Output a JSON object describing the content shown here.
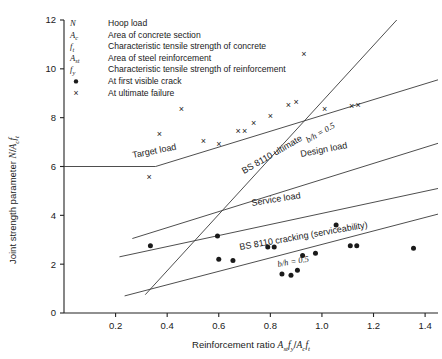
{
  "chart_data": {
    "type": "scatter",
    "title": "",
    "xlabel": "Reinforcement ratio Ast fy / Ac ft",
    "ylabel": "Joint strength parameter N / Ac ft",
    "xlim": [
      0.0,
      1.45
    ],
    "ylim": [
      0,
      12
    ],
    "xticks": [
      "0.2",
      "0.4",
      "0.6",
      "0.8",
      "1.0",
      "1.2",
      "1.4"
    ],
    "xtick_values": [
      0.2,
      0.4,
      0.6,
      0.8,
      1.0,
      1.2,
      1.4
    ],
    "yticks": [
      "0",
      "2",
      "4",
      "6",
      "8",
      "10",
      "12"
    ],
    "ytick_values": [
      0,
      2,
      4,
      6,
      8,
      10,
      12
    ],
    "grid": false,
    "legend_position": "top-left",
    "series": [
      {
        "name": "At first visible crack",
        "marker": "dot",
        "points": [
          [
            0.335,
            2.75
          ],
          [
            0.595,
            3.15
          ],
          [
            0.6,
            2.2
          ],
          [
            0.655,
            2.15
          ],
          [
            0.79,
            2.7
          ],
          [
            0.815,
            2.7
          ],
          [
            0.845,
            1.6
          ],
          [
            0.88,
            1.55
          ],
          [
            0.905,
            1.75
          ],
          [
            0.925,
            2.35
          ],
          [
            0.975,
            2.45
          ],
          [
            1.055,
            3.6
          ],
          [
            1.11,
            2.75
          ],
          [
            1.135,
            2.75
          ],
          [
            1.355,
            2.65
          ]
        ]
      },
      {
        "name": "At ultimate failure",
        "marker": "cross",
        "points": [
          [
            0.33,
            5.6
          ],
          [
            0.37,
            7.35
          ],
          [
            0.455,
            8.35
          ],
          [
            0.54,
            7.05
          ],
          [
            0.6,
            6.95
          ],
          [
            0.675,
            7.45
          ],
          [
            0.7,
            7.45
          ],
          [
            0.735,
            7.8
          ],
          [
            0.8,
            8.1
          ],
          [
            0.87,
            8.55
          ],
          [
            0.9,
            8.65
          ],
          [
            0.93,
            10.6
          ],
          [
            1.01,
            8.35
          ],
          [
            1.115,
            8.5
          ],
          [
            1.14,
            8.55
          ]
        ]
      }
    ],
    "lines": [
      {
        "name": "Target load",
        "label": "Target load",
        "points": [
          [
            0.0,
            6.0
          ],
          [
            0.355,
            6.0
          ],
          [
            1.45,
            9.55
          ]
        ]
      },
      {
        "name": "BS 8110 ultimate",
        "label": "BS 8110 ultimate",
        "sublabel": "b/h = 0.5",
        "points": [
          [
            0.315,
            0.75
          ],
          [
            1.29,
            12.0
          ]
        ]
      },
      {
        "name": "Design load",
        "label": "Design load",
        "points": [
          [
            0.265,
            3.05
          ],
          [
            1.45,
            6.95
          ]
        ]
      },
      {
        "name": "Service load",
        "label": "Service load",
        "points": [
          [
            0.215,
            2.3
          ],
          [
            1.45,
            5.1
          ]
        ]
      },
      {
        "name": "BS 8110 cracking (serviceability)",
        "label": "BS 8110 cracking (serviceability)",
        "sublabel": "b/h = 0.5",
        "points": [
          [
            0.235,
            0.7
          ],
          [
            1.45,
            4.05
          ]
        ]
      }
    ],
    "annotations": [
      {
        "id": "target-load",
        "text": "Target load"
      },
      {
        "id": "bs8110-ultimate",
        "text": "BS 8110 ultimate"
      },
      {
        "id": "bh-upper",
        "text": "b/h = 0.5"
      },
      {
        "id": "design-load",
        "text": "Design load"
      },
      {
        "id": "service-load",
        "text": "Service load"
      },
      {
        "id": "bs8110-cracking",
        "text": "BS 8110 cracking (serviceability)"
      },
      {
        "id": "bh-lower",
        "text": "b/h = 0.5"
      }
    ]
  },
  "axes": {
    "y_title_main": "Joint strength parameter ",
    "y_title_sym_n": "N",
    "y_title_slash": "/",
    "y_title_sym_a": "A",
    "y_title_sub_c": "c",
    "y_title_sym_f": "f",
    "y_title_sub_t": "t",
    "x_title_main": "Reinforcement ratio ",
    "x_title_ast": "A",
    "x_title_ast_sub": "st",
    "x_title_fy": "f",
    "x_title_fy_sub": "y",
    "x_title_slash": "/",
    "x_title_ac": "A",
    "x_title_ac_sub": "c",
    "x_title_ft": "f",
    "x_title_ft_sub": "t"
  },
  "legend": {
    "items": [
      {
        "symbol": "N",
        "sub": "",
        "marker": "",
        "label": "Hoop load"
      },
      {
        "symbol": "A",
        "sub": "c",
        "marker": "",
        "label": "Area of concrete section"
      },
      {
        "symbol": "f",
        "sub": "t",
        "marker": "",
        "label": "Characteristic tensile strength of concrete"
      },
      {
        "symbol": "A",
        "sub": "st",
        "marker": "",
        "label": "Area of steel reinforcement"
      },
      {
        "symbol": "f",
        "sub": "y",
        "marker": "",
        "label": "Characteristic tensile strength of reinforcement"
      },
      {
        "symbol": "",
        "sub": "",
        "marker": "dot",
        "label": "At first visible crack"
      },
      {
        "symbol": "",
        "sub": "",
        "marker": "cross",
        "label": "At ultimate failure"
      }
    ]
  },
  "colors": {
    "background": "#ffffff",
    "axis": "#222222",
    "line": "#3a3a3a",
    "marker": "#1a1a1a"
  }
}
